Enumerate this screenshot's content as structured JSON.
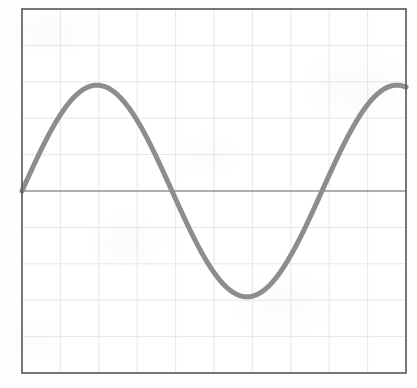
{
  "figure": {
    "name": "sine-wave-plot",
    "width": 417,
    "height": 388,
    "background_color": "#fefefe"
  },
  "plot_area": {
    "left": 22,
    "top": 9,
    "width": 384,
    "height": 364,
    "frame_color": "#555555",
    "frame_width": 1.6,
    "fill_color": "#ffffff"
  },
  "grid": {
    "visible": true,
    "color": "#e6e6ec",
    "line_width": 1,
    "x_divisions": 10,
    "y_divisions": 10
  },
  "zero_axis": {
    "visible": true,
    "color": "#6a6a6a",
    "line_width": 1.2,
    "y_value": 0
  },
  "curve": {
    "color": "#8d8d8d",
    "line_width": 5,
    "line_cap": "round"
  },
  "chart_data": {
    "type": "line",
    "title": "",
    "subtitle": "",
    "xlabel": "",
    "ylabel": "",
    "xlim": [
      0,
      1.28
    ],
    "ylim": [
      -1.72,
      1.72
    ],
    "grid": true,
    "legend": null,
    "xticks": [],
    "yticks": [],
    "annotations": [],
    "series": [
      {
        "name": "sine",
        "function": "y = sin(2*pi*x)",
        "amplitude": 1.0,
        "period": 1.0,
        "phase": 0.0,
        "x": [
          0.0,
          0.04,
          0.08,
          0.12,
          0.16,
          0.2,
          0.24,
          0.28,
          0.32,
          0.36,
          0.4,
          0.44,
          0.48,
          0.52,
          0.56,
          0.6,
          0.64,
          0.68,
          0.72,
          0.76,
          0.8,
          0.84,
          0.88,
          0.92,
          0.96,
          1.0,
          1.04,
          1.08,
          1.12,
          1.16,
          1.2,
          1.24,
          1.28
        ],
        "y": [
          0.0,
          0.249,
          0.482,
          0.685,
          0.844,
          0.951,
          0.998,
          0.982,
          0.905,
          0.771,
          0.588,
          0.368,
          0.125,
          -0.125,
          -0.368,
          -0.588,
          -0.771,
          -0.905,
          -0.982,
          -0.998,
          -0.951,
          -0.844,
          -0.685,
          -0.482,
          -0.249,
          0.0,
          0.249,
          0.482,
          0.685,
          0.844,
          0.951,
          0.998,
          0.982
        ]
      }
    ],
    "key_points": {
      "start": {
        "x": 0.0,
        "y": 0.0
      },
      "peak": {
        "x": 0.25,
        "y": 1.0
      },
      "descending_zero": {
        "x": 0.5,
        "y": 0.0
      },
      "trough": {
        "x": 0.75,
        "y": -1.0
      },
      "ascending_zero": {
        "x": 1.0,
        "y": 0.0
      },
      "end": {
        "x": 1.28,
        "y": 0.98
      }
    }
  }
}
